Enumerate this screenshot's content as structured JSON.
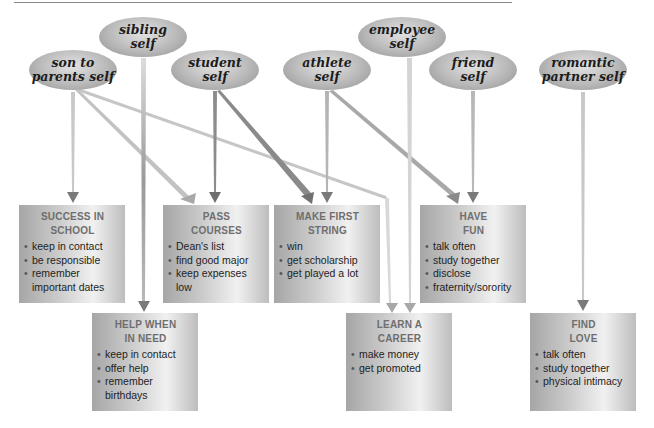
{
  "selves": [
    {
      "id": "son",
      "line1": "son to",
      "line2": "parents self"
    },
    {
      "id": "sibling",
      "line1": "sibling",
      "line2": "self"
    },
    {
      "id": "student",
      "line1": "student",
      "line2": "self"
    },
    {
      "id": "athlete",
      "line1": "athlete",
      "line2": "self"
    },
    {
      "id": "employee",
      "line1": "employee",
      "line2": "self"
    },
    {
      "id": "friend",
      "line1": "friend",
      "line2": "self"
    },
    {
      "id": "romantic",
      "line1": "romantic",
      "line2": "partner self"
    }
  ],
  "goals": [
    {
      "id": "success",
      "title1": "SUCCESS IN",
      "title2": "SCHOOL",
      "items": [
        "keep in contact",
        "be responsible",
        "remember important dates"
      ]
    },
    {
      "id": "pass",
      "title1": "PASS",
      "title2": "COURSES",
      "items": [
        "Dean's list",
        "find good major",
        "keep expenses low"
      ]
    },
    {
      "id": "string",
      "title1": "MAKE FIRST",
      "title2": "STRING",
      "items": [
        "win",
        "get scholarship",
        "get played a lot"
      ]
    },
    {
      "id": "fun",
      "title1": "HAVE",
      "title2": "FUN",
      "items": [
        "talk often",
        "study together",
        "disclose",
        "fraternity/sorority"
      ]
    },
    {
      "id": "help",
      "title1": "HELP WHEN",
      "title2": "IN NEED",
      "items": [
        "keep in contact",
        "offer help",
        "remember birthdays"
      ]
    },
    {
      "id": "career",
      "title1": "LEARN A",
      "title2": "CAREER",
      "items": [
        "make money",
        "get promoted"
      ]
    },
    {
      "id": "love",
      "title1": "FIND",
      "title2": "LOVE",
      "items": [
        "talk often",
        "study together",
        "physical intimacy"
      ]
    }
  ],
  "connections": [
    {
      "from": "son to parents self",
      "to": "SUCCESS IN SCHOOL"
    },
    {
      "from": "son to parents self",
      "to": "PASS COURSES"
    },
    {
      "from": "son to parents self",
      "to": "LEARN A CAREER"
    },
    {
      "from": "sibling self",
      "to": "HELP WHEN IN NEED"
    },
    {
      "from": "student self",
      "to": "PASS COURSES"
    },
    {
      "from": "student self",
      "to": "MAKE FIRST STRING"
    },
    {
      "from": "athlete self",
      "to": "MAKE FIRST STRING"
    },
    {
      "from": "athlete self",
      "to": "HAVE FUN"
    },
    {
      "from": "employee self",
      "to": "LEARN A CAREER"
    },
    {
      "from": "friend self",
      "to": "HAVE FUN"
    },
    {
      "from": "romantic partner self",
      "to": "FIND LOVE"
    }
  ],
  "colors": {
    "arrow_dark": "#7a7a7a",
    "arrow_light": "#c4c4c4",
    "title_gray": "#6e6e6e"
  }
}
